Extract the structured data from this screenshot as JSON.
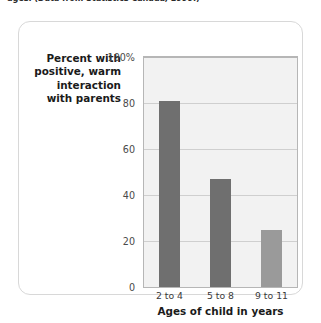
{
  "caption": {
    "text": "ages. (Data from Statistics Canada, 1999.)"
  },
  "chart_data": {
    "type": "bar",
    "title": "",
    "categories": [
      "2 to 4",
      "5 to 8",
      "9 to 11"
    ],
    "values": [
      81,
      47,
      25
    ],
    "series": [
      {
        "name": "Percent with positive, warm interaction with parents",
        "values": [
          81,
          47,
          25
        ]
      }
    ],
    "xlabel": "Ages of child in years",
    "ylabel": "Percent with positive, warm interaction with parents",
    "ylabel_lines": [
      "Percent with",
      "positive, warm",
      "interaction",
      "with parents"
    ],
    "ylim": [
      0,
      100
    ],
    "ytick_values": [
      100,
      80,
      60,
      40,
      20,
      0
    ],
    "ytick_labels": [
      "100%",
      "80",
      "60",
      "40",
      "20",
      "0"
    ],
    "grid": true,
    "legend": "none",
    "bar_colors": [
      "#6f6f6f",
      "#6f6f6f",
      "#9a9a9a"
    ],
    "plot_background": "#f2f2f2",
    "axis_color": "#b6b6b6",
    "gridline_color": "#cfcfcf"
  }
}
